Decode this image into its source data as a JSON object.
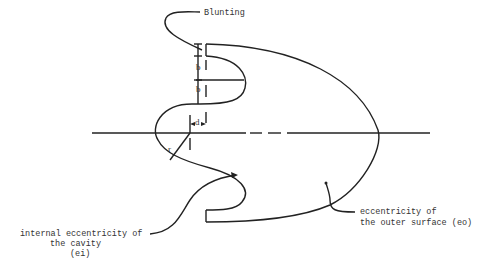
{
  "diagram": {
    "labels": {
      "blunting": "Blunting",
      "b_upper": "b",
      "b_lower": "b",
      "d": "d",
      "r": "r",
      "internal_line1": "internal eccentricity of",
      "internal_line2": "the cavity",
      "internal_line3": "(ei)",
      "outer_line1": "eccentricity of",
      "outer_line2": "the outer surface (eo)"
    },
    "colors": {
      "stroke": "#222222",
      "text": "#333333",
      "background": "#ffffff"
    }
  }
}
